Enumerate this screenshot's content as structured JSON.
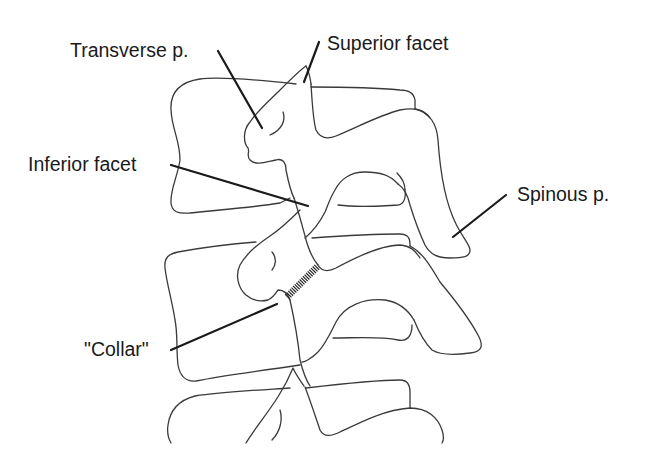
{
  "figure": {
    "colors": {
      "background": "#ffffff",
      "outline": "#3a3a3a",
      "leader_line": "#1a1a1a",
      "text": "#1a1a1a"
    }
  },
  "labels": {
    "transverse_process": "Transverse p.",
    "superior_facet": "Superior facet",
    "inferior_facet": "Inferior facet",
    "spinous_process": "Spinous p.",
    "collar": "\"Collar\""
  }
}
